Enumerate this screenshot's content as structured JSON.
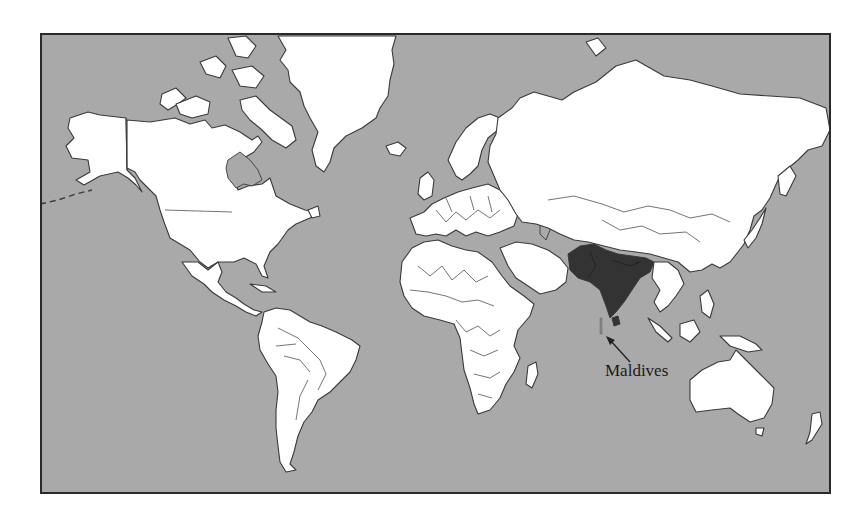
{
  "map": {
    "projection": "mercator",
    "colors": {
      "ocean": "#a9a9a9",
      "land": "#ffffff",
      "outline": "#3a3a3a",
      "highlight": "#333333"
    },
    "highlighted_region": "South Asia",
    "highlighted_countries": [
      "Pakistan",
      "Afghanistan",
      "India",
      "Nepal",
      "Bhutan",
      "Bangladesh",
      "Sri Lanka",
      "Maldives"
    ],
    "annotations": [
      {
        "label": "Maldives",
        "arrow_from": [
          630,
          362
        ],
        "arrow_to": [
          608,
          338
        ]
      }
    ]
  }
}
